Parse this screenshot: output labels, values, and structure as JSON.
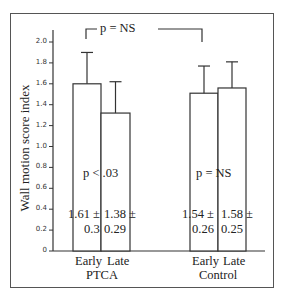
{
  "chart_data": {
    "type": "bar",
    "title": "",
    "xlabel": "",
    "ylabel": "Wall motion score index",
    "ylim": [
      0,
      2.0
    ],
    "yticks": [
      "0",
      "0.2",
      "0.4",
      "0.6",
      "0.8",
      "1.0",
      "1.2",
      "1.4",
      "1.6",
      "1.8",
      "2.0"
    ],
    "grid": false,
    "groups": [
      {
        "name": "PTCA",
        "categories": [
          "Early",
          "Late"
        ],
        "values": [
          1.61,
          1.38
        ],
        "sd": [
          0.3,
          0.29
        ],
        "labels": [
          "1.61 ±",
          "1.38 ±"
        ],
        "sd_labels": [
          "0.3",
          "0.29"
        ],
        "p_label": "p < .03"
      },
      {
        "name": "Control",
        "categories": [
          "Early",
          "Late"
        ],
        "values": [
          1.54,
          1.58
        ],
        "sd": [
          0.26,
          0.25
        ],
        "labels": [
          "1.54 ±",
          "1.58 ±"
        ],
        "sd_labels": [
          "0.26",
          "0.25"
        ],
        "p_label": "p = NS"
      }
    ],
    "bracket_label": "p = NS"
  }
}
